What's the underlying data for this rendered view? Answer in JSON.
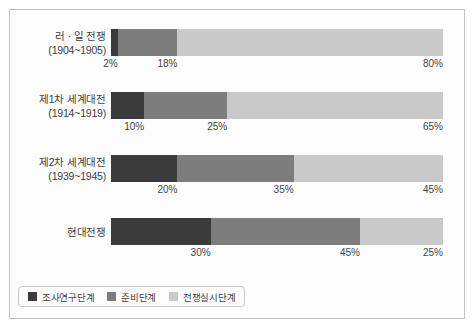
{
  "chart_data": {
    "type": "bar",
    "subtype": "stacked-horizontal-100pct",
    "title": "",
    "xlabel": "",
    "ylabel": "",
    "xlim": [
      0,
      100
    ],
    "grid": false,
    "legend_position": "bottom-left",
    "orientation": "horizontal",
    "value_suffix": "%",
    "categories": [
      "러 · 일 전쟁\n(1904~1905)",
      "제1차 세계대전\n(1914~1919)",
      "제2차 세계대전\n(1939~1945)",
      "현대전쟁"
    ],
    "series": [
      {
        "name": "조사연구단계",
        "color": "#3b3b3b",
        "values": [
          2,
          10,
          20,
          30
        ]
      },
      {
        "name": "준비단계",
        "color": "#7d7d7d",
        "values": [
          18,
          25,
          35,
          45
        ]
      },
      {
        "name": "전쟁실시단계",
        "color": "#c9c9c9",
        "values": [
          80,
          65,
          45,
          25
        ]
      }
    ]
  },
  "rows": [
    {
      "name": "러 · 일 전쟁",
      "years": "(1904~1905)",
      "segments": [
        {
          "label": "2%",
          "value": 2
        },
        {
          "label": "18%",
          "value": 18
        },
        {
          "label": "80%",
          "value": 80
        }
      ]
    },
    {
      "name": "제1차 세계대전",
      "years": "(1914~1919)",
      "segments": [
        {
          "label": "10%",
          "value": 10
        },
        {
          "label": "25%",
          "value": 25
        },
        {
          "label": "65%",
          "value": 65
        }
      ]
    },
    {
      "name": "제2차 세계대전",
      "years": "(1939~1945)",
      "segments": [
        {
          "label": "20%",
          "value": 20
        },
        {
          "label": "35%",
          "value": 35
        },
        {
          "label": "45%",
          "value": 45
        }
      ]
    },
    {
      "name": "현대전쟁",
      "years": "",
      "segments": [
        {
          "label": "30%",
          "value": 30
        },
        {
          "label": "45%",
          "value": 45
        },
        {
          "label": "25%",
          "value": 25
        }
      ]
    }
  ],
  "legend": {
    "items": [
      {
        "label": "조사연구단계",
        "color": "#3b3b3b"
      },
      {
        "label": "준비단계",
        "color": "#7d7d7d"
      },
      {
        "label": "전쟁실시단계",
        "color": "#c9c9c9"
      }
    ]
  },
  "style": {
    "frame_color": "#c2c2c2",
    "background": "#fdfdfd",
    "text_color": "#3d3d3d"
  }
}
